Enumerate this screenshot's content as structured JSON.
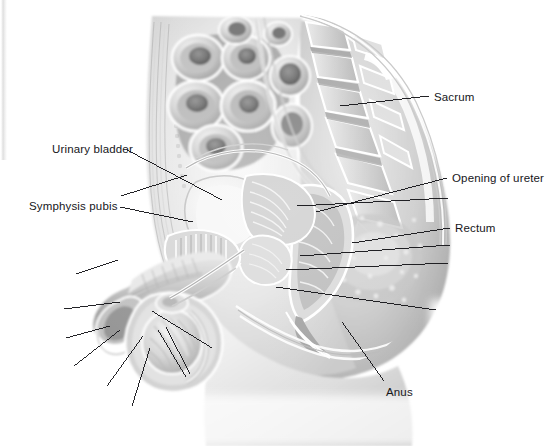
{
  "figure": {
    "kind": "grayscale-medical-illustration",
    "background_color": "#ffffff",
    "ink_color": "#16161a",
    "tone_light": "#f2f2f2",
    "tone_mid": "#bdbdbd",
    "tone_dark": "#8a8a8a",
    "tone_deep": "#5c5c5c",
    "tone_shadow": "#3a3a3a"
  },
  "labels": [
    {
      "id": "sacrum",
      "text": "Sacrum",
      "x": 434,
      "y": 91,
      "align": "left"
    },
    {
      "id": "urinary-bladder",
      "text": "Urinary bladder",
      "x": 52,
      "y": 143,
      "align": "left"
    },
    {
      "id": "opening-of-ureter",
      "text": "Opening of ureter",
      "x": 452,
      "y": 172,
      "align": "left"
    },
    {
      "id": "symphysis-pubis",
      "text": "Symphysis pubis",
      "x": 29,
      "y": 200,
      "align": "left"
    },
    {
      "id": "rectum",
      "text": "Rectum",
      "x": 455,
      "y": 222,
      "align": "left"
    },
    {
      "id": "anus",
      "text": "Anus",
      "x": 386,
      "y": 386,
      "align": "left"
    }
  ],
  "leader_lines": [
    {
      "id": "leader-sacrum",
      "label": "Sacrum",
      "x1": 340,
      "y1": 106,
      "x2": 429,
      "y2": 96
    },
    {
      "id": "leader-urinary-bladder",
      "label": "Urinary bladder",
      "x1": 127,
      "y1": 150,
      "x2": 222,
      "y2": 200
    },
    {
      "id": "leader-opening-of-ureter",
      "label": "Opening of ureter",
      "x1": 316,
      "y1": 212,
      "x2": 447,
      "y2": 178
    },
    {
      "id": "leader-symphysis-pubis",
      "label": "Symphysis pubis",
      "x1": 120,
      "y1": 207,
      "x2": 193,
      "y2": 222
    },
    {
      "id": "leader-rectum",
      "label": "Rectum",
      "x1": 352,
      "y1": 243,
      "x2": 450,
      "y2": 228
    },
    {
      "id": "leader-anus",
      "label": "Anus",
      "x1": 342,
      "y1": 322,
      "x2": 384,
      "y2": 381
    },
    {
      "id": "leader-blank-1",
      "label": "",
      "x1": 121,
      "y1": 196,
      "x2": 187,
      "y2": 175
    },
    {
      "id": "leader-blank-2",
      "label": "",
      "x1": 297,
      "y1": 206,
      "x2": 448,
      "y2": 198
    },
    {
      "id": "leader-blank-3",
      "label": "",
      "x1": 300,
      "y1": 256,
      "x2": 450,
      "y2": 245
    },
    {
      "id": "leader-blank-4",
      "label": "",
      "x1": 286,
      "y1": 270,
      "x2": 448,
      "y2": 263
    },
    {
      "id": "leader-blank-5",
      "label": "",
      "x1": 276,
      "y1": 287,
      "x2": 436,
      "y2": 310
    },
    {
      "id": "leader-blank-6",
      "label": "",
      "x1": 76,
      "y1": 274,
      "x2": 118,
      "y2": 260
    },
    {
      "id": "leader-blank-7",
      "label": "",
      "x1": 64,
      "y1": 309,
      "x2": 120,
      "y2": 302
    },
    {
      "id": "leader-blank-8",
      "label": "",
      "x1": 66,
      "y1": 338,
      "x2": 110,
      "y2": 326
    },
    {
      "id": "leader-blank-9",
      "label": "",
      "x1": 74,
      "y1": 366,
      "x2": 120,
      "y2": 330
    },
    {
      "id": "leader-blank-10",
      "label": "",
      "x1": 107,
      "y1": 386,
      "x2": 143,
      "y2": 336
    },
    {
      "id": "leader-blank-11",
      "label": "",
      "x1": 132,
      "y1": 406,
      "x2": 150,
      "y2": 348
    },
    {
      "id": "leader-blank-12",
      "label": "",
      "x1": 158,
      "y1": 330,
      "x2": 186,
      "y2": 377
    },
    {
      "id": "leader-blank-13",
      "label": "",
      "x1": 166,
      "y1": 327,
      "x2": 190,
      "y2": 374
    },
    {
      "id": "leader-blank-14",
      "label": "",
      "x1": 152,
      "y1": 311,
      "x2": 212,
      "y2": 348
    }
  ]
}
